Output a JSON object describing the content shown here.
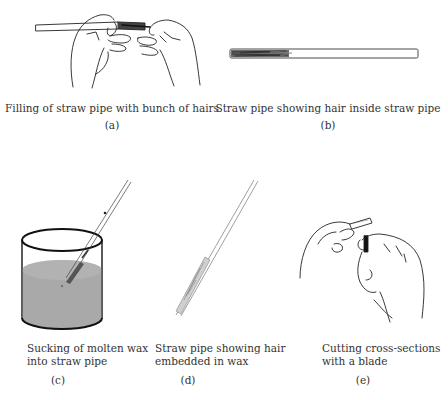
{
  "figure": {
    "panels": [
      {
        "id": "a",
        "caption": "Filling of straw pipe with bunch of hairs",
        "label": "(a)",
        "illustration": "hands-filling-straw-icon"
      },
      {
        "id": "b",
        "caption": "Straw pipe showing hair inside straw pipe",
        "label": "(b)",
        "illustration": "straw-pipe-with-hair-icon"
      },
      {
        "id": "c",
        "caption_lines": [
          "Sucking of molten wax",
          "into straw pipe"
        ],
        "label": "(c)",
        "illustration": "beaker-molten-wax-icon"
      },
      {
        "id": "d",
        "caption_lines": [
          "Straw pipe showing hair",
          "embedded in wax"
        ],
        "label": "(d)",
        "illustration": "straw-hair-in-wax-icon"
      },
      {
        "id": "e",
        "caption_lines": [
          "Cutting cross-sections",
          "with a blade"
        ],
        "label": "(e)",
        "illustration": "hands-cutting-blade-icon"
      }
    ],
    "colors": {
      "line": "#222222",
      "wax_fill": "#a9a9a9",
      "hair": "#3a3a3a",
      "text": "#333333"
    }
  }
}
